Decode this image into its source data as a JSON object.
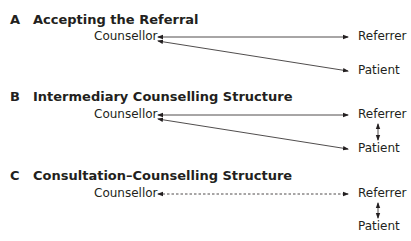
{
  "sections": [
    {
      "letter": "A",
      "title": "Accepting the Referral",
      "nodes": {
        "counsellor": "Counsellor",
        "referrer": "Referrer",
        "patient": "Patient"
      }
    },
    {
      "letter": "B",
      "title": "Intermediary Counselling Structure",
      "nodes": {
        "counsellor": "Counsellor",
        "referrer": "Referrer",
        "patient": "Patient"
      }
    },
    {
      "letter": "C",
      "title": "Consultation–Counselling Structure",
      "nodes": {
        "counsellor": "Counsellor",
        "referrer": "Referrer",
        "patient": "Patient"
      }
    }
  ]
}
